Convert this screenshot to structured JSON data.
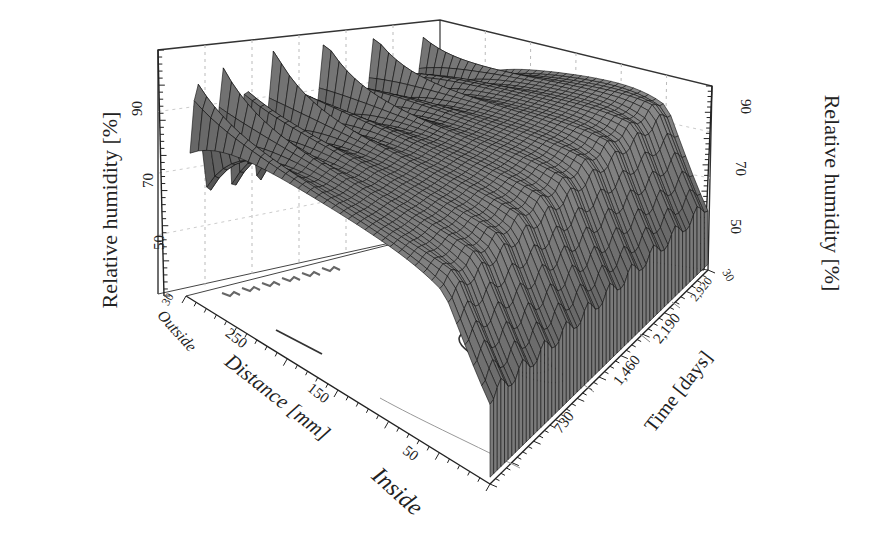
{
  "chart_data": {
    "type": "surface3d",
    "title": "",
    "axes": {
      "z_left": {
        "label": "Relative humidity [%]",
        "ticks": [
          "30",
          "50",
          "70",
          "90"
        ],
        "range": [
          30,
          100
        ]
      },
      "z_right": {
        "label": "Relative humidity [%]",
        "ticks": [
          "30",
          "50",
          "70",
          "90"
        ],
        "range": [
          30,
          100
        ]
      },
      "x": {
        "label": "Distance [mm]",
        "ticks": [
          "250",
          "150",
          "50"
        ],
        "start_label": "Outside",
        "end_label": "Inside",
        "start_tick": "300",
        "range": [
          300,
          0
        ]
      },
      "y": {
        "label": "Time [days]",
        "ticks": [
          "730",
          "1,460",
          "2,190",
          "2,920"
        ],
        "end_tick": "3650",
        "range": [
          0,
          3650
        ]
      }
    },
    "grid": true,
    "style": "wireframe surface, grayscale, with projected contours on floor",
    "series": [
      {
        "name": "Outside surface (300 mm)",
        "rh_range": [
          58,
          96
        ],
        "behaviour": "high-frequency seasonal spikes"
      },
      {
        "name": "Wall core (~150-250 mm)",
        "rh_range": [
          80,
          92
        ],
        "behaviour": "smooth ridge, slowly rising"
      },
      {
        "name": "Inside surface (0 mm)",
        "rh_range": [
          55,
          82
        ],
        "behaviour": "annual oscillation, ~10 cycles"
      }
    ]
  },
  "labels": {
    "left_ylabel": "Relative humidity [%]",
    "right_ylabel": "Relative humidity [%]",
    "left_ticks": [
      "90",
      "70",
      "50",
      "30"
    ],
    "right_ticks": [
      "90",
      "70",
      "50",
      "30"
    ],
    "outside": "Outside",
    "inside": "Inside",
    "distance_title": "Distance [mm]",
    "distance_ticks": [
      "300",
      "250",
      "150",
      "50"
    ],
    "time_title": "Time [days]",
    "time_ticks": [
      "730",
      "1,460",
      "2,190",
      "2,920",
      "3650"
    ]
  }
}
